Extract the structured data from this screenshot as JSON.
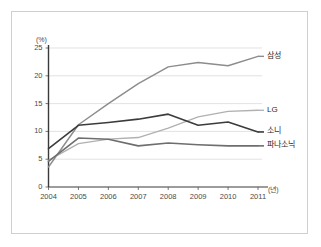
{
  "chart_data": {
    "type": "line",
    "title": "",
    "xlabel": "(년)",
    "ylabel": "(%)",
    "x": [
      2004,
      2005,
      2006,
      2007,
      2008,
      2009,
      2010,
      2011
    ],
    "categories": [
      "2004",
      "2005",
      "2006",
      "2007",
      "2008",
      "2009",
      "2010",
      "2011"
    ],
    "xlim": [
      2004,
      2011
    ],
    "ylim": [
      0,
      25
    ],
    "yticks": [
      0,
      5,
      10,
      15,
      20,
      25
    ],
    "ytick_labels": [
      "0",
      "5",
      "10",
      "15",
      "20",
      "25"
    ],
    "xtick_labels": [
      "2004",
      "2005",
      "2006",
      "2007",
      "2008",
      "2009",
      "2010",
      "2011"
    ],
    "grid": true,
    "grid_axis": "y",
    "legend_position": "right-inline",
    "series": [
      {
        "name": "삼성",
        "label": "삼성",
        "color": "#8c8c8c",
        "width": 1.4,
        "values": [
          3.6,
          11.2,
          15.0,
          18.6,
          21.6,
          22.4,
          21.8,
          23.5
        ]
      },
      {
        "name": "LG",
        "label": "LG",
        "color": "#b0b0b0",
        "width": 1.3,
        "values": [
          4.8,
          7.8,
          8.6,
          8.9,
          10.6,
          12.6,
          13.6,
          13.8
        ]
      },
      {
        "name": "소니",
        "label": "소니",
        "color": "#3c3c3c",
        "width": 1.6,
        "values": [
          6.9,
          11.1,
          11.6,
          12.2,
          13.1,
          11.1,
          11.7,
          9.9
        ]
      },
      {
        "name": "파나소닉",
        "label": "파나소닉",
        "color": "#6e6e6e",
        "width": 1.6,
        "values": [
          4.6,
          8.8,
          8.6,
          7.4,
          7.9,
          7.6,
          7.4,
          7.4
        ]
      }
    ]
  }
}
